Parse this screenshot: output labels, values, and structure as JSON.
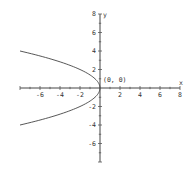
{
  "chart_data": {
    "type": "line",
    "title": "",
    "xlabel": "x",
    "ylabel": "y",
    "xlim": [
      -8,
      8
    ],
    "ylim": [
      -8,
      8
    ],
    "grid": false,
    "x_ticks": [
      -6,
      -4,
      -2,
      2,
      4,
      6,
      8
    ],
    "y_ticks": [
      8,
      6,
      4,
      2,
      -2,
      -4,
      -6
    ],
    "series": [
      {
        "name": "parabola x = -y^2/2",
        "points": [
          {
            "x": -8,
            "y": 4
          },
          {
            "x": -6.125,
            "y": 3.5
          },
          {
            "x": -4.5,
            "y": 3
          },
          {
            "x": -3.125,
            "y": 2.5
          },
          {
            "x": -2,
            "y": 2
          },
          {
            "x": -1.125,
            "y": 1.5
          },
          {
            "x": -0.5,
            "y": 1
          },
          {
            "x": -0.125,
            "y": 0.5
          },
          {
            "x": 0,
            "y": 0
          },
          {
            "x": -0.125,
            "y": -0.5
          },
          {
            "x": -0.5,
            "y": -1
          },
          {
            "x": -1.125,
            "y": -1.5
          },
          {
            "x": -2,
            "y": -2
          },
          {
            "x": -3.125,
            "y": -2.5
          },
          {
            "x": -4.5,
            "y": -3
          },
          {
            "x": -6.125,
            "y": -3.5
          },
          {
            "x": -8,
            "y": -4
          }
        ]
      }
    ],
    "annotations": [
      {
        "text": "(0, 0)",
        "x": 0,
        "y": 0
      }
    ]
  }
}
